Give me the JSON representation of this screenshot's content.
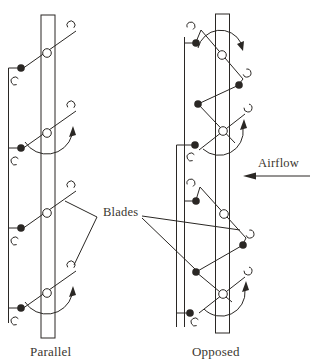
{
  "canvas": {
    "width": 313,
    "height": 363,
    "background": "#ffffff"
  },
  "style": {
    "line_color": "#2a2724",
    "text_color": "#3a362f",
    "pivot_fill": "#ffffff",
    "stroke_width": 1
  },
  "labels": {
    "parallel": {
      "text": "Parallel"
    },
    "opposed": {
      "text": "Opposed"
    },
    "blades": {
      "text": "Blades"
    },
    "airflow": {
      "text": "Airflow"
    }
  },
  "shapes": [
    {
      "name": "parallel-duct",
      "type": "rect",
      "x": 41,
      "y": 15,
      "w": 14,
      "h": 323
    },
    {
      "name": "parallel-drive-rod",
      "type": "line",
      "x1": 8.5,
      "y1": 68,
      "x2": 8.5,
      "y2": 323
    },
    {
      "name": "parallel-blade-1-line",
      "type": "line",
      "x1": 22,
      "y1": 69,
      "x2": 76,
      "y2": 31
    },
    {
      "name": "parallel-blade-1-top-hook",
      "type": "hook",
      "cx": 71,
      "cy": 25,
      "r": 4,
      "gap": 95
    },
    {
      "name": "parallel-blade-1-link-tick",
      "type": "line",
      "x1": 8.5,
      "y1": 68,
      "x2": 21,
      "y2": 68
    },
    {
      "name": "parallel-blade-1-crank-pin",
      "type": "dot",
      "cx": 21,
      "cy": 68,
      "r": 3.8
    },
    {
      "name": "parallel-blade-1-lower-hook",
      "type": "hook",
      "cx": 15,
      "cy": 81,
      "r": 4,
      "gap": 15
    },
    {
      "name": "parallel-blade-1-pivot",
      "type": "pivot",
      "cx": 47,
      "cy": 53,
      "r": 4.3
    },
    {
      "name": "parallel-blade-2-line",
      "type": "line",
      "x1": 22,
      "y1": 149,
      "x2": 76,
      "y2": 111
    },
    {
      "name": "parallel-blade-2-top-hook",
      "type": "hook",
      "cx": 71,
      "cy": 105,
      "r": 4,
      "gap": 95
    },
    {
      "name": "parallel-blade-2-link-tick",
      "type": "line",
      "x1": 8.5,
      "y1": 148,
      "x2": 21,
      "y2": 148
    },
    {
      "name": "parallel-blade-2-crank-pin",
      "type": "dot",
      "cx": 21,
      "cy": 148,
      "r": 3.8
    },
    {
      "name": "parallel-blade-2-lower-hook",
      "type": "hook",
      "cx": 15,
      "cy": 161,
      "r": 4,
      "gap": 15
    },
    {
      "name": "parallel-blade-2-pivot",
      "type": "pivot",
      "cx": 47,
      "cy": 133,
      "r": 4.3
    },
    {
      "name": "parallel-blade-2-rotation-arrow",
      "type": "rotarc",
      "x1": 25,
      "y1": 142,
      "x2": 72,
      "y2": 135,
      "r": 26,
      "sweep": 0,
      "arrow": [
        [
          73,
          126
        ],
        [
          69,
          137
        ],
        [
          76,
          135
        ]
      ]
    },
    {
      "name": "parallel-blade-3-line",
      "type": "line",
      "x1": 22,
      "y1": 229,
      "x2": 76,
      "y2": 191
    },
    {
      "name": "parallel-blade-3-top-hook",
      "type": "hook",
      "cx": 71,
      "cy": 185,
      "r": 4,
      "gap": 95
    },
    {
      "name": "parallel-blade-3-link-tick",
      "type": "line",
      "x1": 8.5,
      "y1": 228,
      "x2": 21,
      "y2": 228
    },
    {
      "name": "parallel-blade-3-crank-pin",
      "type": "dot",
      "cx": 21,
      "cy": 228,
      "r": 3.8
    },
    {
      "name": "parallel-blade-3-lower-hook",
      "type": "hook",
      "cx": 15,
      "cy": 241,
      "r": 4,
      "gap": 15
    },
    {
      "name": "parallel-blade-3-pivot",
      "type": "pivot",
      "cx": 47,
      "cy": 213,
      "r": 4.3
    },
    {
      "name": "parallel-blade-4-line",
      "type": "line",
      "x1": 22,
      "y1": 309,
      "x2": 76,
      "y2": 271
    },
    {
      "name": "parallel-blade-4-top-hook",
      "type": "hook",
      "cx": 71,
      "cy": 265,
      "r": 4,
      "gap": 95
    },
    {
      "name": "parallel-blade-4-link-tick",
      "type": "line",
      "x1": 8.5,
      "y1": 308,
      "x2": 21,
      "y2": 308
    },
    {
      "name": "parallel-blade-4-crank-pin",
      "type": "dot",
      "cx": 21,
      "cy": 308,
      "r": 3.8
    },
    {
      "name": "parallel-blade-4-lower-hook",
      "type": "hook",
      "cx": 15,
      "cy": 321,
      "r": 4,
      "gap": 15
    },
    {
      "name": "parallel-blade-4-pivot",
      "type": "pivot",
      "cx": 47,
      "cy": 293,
      "r": 4.3
    },
    {
      "name": "parallel-blade-4-rotation-arrow",
      "type": "rotarc",
      "x1": 25,
      "y1": 302,
      "x2": 72,
      "y2": 295,
      "r": 26,
      "sweep": 0,
      "arrow": [
        [
          73,
          286
        ],
        [
          69,
          297
        ],
        [
          76,
          295
        ]
      ]
    },
    {
      "name": "opposed-duct",
      "type": "rect",
      "x": 215.5,
      "y": 14,
      "w": 14,
      "h": 319
    },
    {
      "name": "opposed-drive-rod-upper",
      "type": "line",
      "x1": 184.5,
      "y1": 37,
      "x2": 184.5,
      "y2": 327
    },
    {
      "name": "opposed-drive-rod-lower",
      "type": "line",
      "x1": 176.5,
      "y1": 145,
      "x2": 176.5,
      "y2": 327
    },
    {
      "name": "opposed-link-tick-1",
      "type": "line",
      "x1": 184.5,
      "y1": 43,
      "x2": 193,
      "y2": 43
    },
    {
      "name": "opposed-link-tick-2",
      "type": "line",
      "x1": 176.5,
      "y1": 145,
      "x2": 192,
      "y2": 145
    },
    {
      "name": "opposed-link-tick-3",
      "type": "line",
      "x1": 184.5,
      "y1": 201,
      "x2": 193,
      "y2": 201
    },
    {
      "name": "opposed-link-tick-4",
      "type": "line",
      "x1": 176.5,
      "y1": 313,
      "x2": 187,
      "y2": 313
    },
    {
      "name": "opposed-blade-1-line",
      "type": "line",
      "x1": 201,
      "y1": 30,
      "x2": 243,
      "y2": 79
    },
    {
      "name": "opposed-blade-1-upper-arm",
      "type": "line",
      "x1": 201,
      "y1": 30,
      "x2": 196,
      "y2": 42
    },
    {
      "name": "opposed-blade-1-upper-pin",
      "type": "dot",
      "cx": 196,
      "cy": 43,
      "r": 3.8
    },
    {
      "name": "opposed-blade-1-upper-hook",
      "type": "hook",
      "cx": 191,
      "cy": 26,
      "r": 4,
      "gap": 110
    },
    {
      "name": "opposed-blade-1-lower-arm",
      "type": "line",
      "x1": 243,
      "y1": 79,
      "x2": 239,
      "y2": 84
    },
    {
      "name": "opposed-blade-1-lower-pin",
      "type": "dot",
      "cx": 239,
      "cy": 85,
      "r": 3.8
    },
    {
      "name": "opposed-blade-1-lower-hook",
      "type": "hook",
      "cx": 247,
      "cy": 73,
      "r": 4,
      "gap": 210
    },
    {
      "name": "opposed-blade-1-pivot",
      "type": "pivot",
      "cx": 222,
      "cy": 55,
      "r": 4.3
    },
    {
      "name": "opposed-blade-1-rotation-arrow",
      "type": "rotarc",
      "x1": 198,
      "y1": 48,
      "x2": 241,
      "y2": 43,
      "r": 23,
      "sweep": 1,
      "arrow": [
        [
          243,
          51
        ],
        [
          237,
          44
        ],
        [
          244,
          41
        ]
      ]
    },
    {
      "name": "opposed-link-blade1-blade2",
      "type": "line",
      "x1": 239,
      "y1": 85,
      "x2": 198,
      "y2": 104
    },
    {
      "name": "opposed-link-joint-pin-1",
      "type": "dot",
      "cx": 198,
      "cy": 104,
      "r": 3.8
    },
    {
      "name": "opposed-blade-2-crank-lever",
      "type": "line",
      "x1": 198,
      "y1": 104,
      "x2": 235,
      "y2": 143
    },
    {
      "name": "opposed-blade-2-line",
      "type": "line",
      "x1": 199,
      "y1": 150,
      "x2": 245,
      "y2": 114
    },
    {
      "name": "opposed-blade-2-top-hook",
      "type": "hook",
      "cx": 248,
      "cy": 108,
      "r": 4,
      "gap": 235
    },
    {
      "name": "opposed-blade-2-lower-pin",
      "type": "dot",
      "cx": 195,
      "cy": 145,
      "r": 3.8
    },
    {
      "name": "opposed-blade-2-lower-hook",
      "type": "hook",
      "cx": 191,
      "cy": 157,
      "r": 4,
      "gap": 15
    },
    {
      "name": "opposed-blade-2-pivot",
      "type": "pivot",
      "cx": 223,
      "cy": 131,
      "r": 4.3
    },
    {
      "name": "opposed-blade-2-rotation-arrow",
      "type": "rotarc",
      "x1": 203,
      "y1": 149,
      "x2": 243,
      "y2": 128,
      "r": 24,
      "sweep": 0,
      "arrow": [
        [
          244,
          119
        ],
        [
          240,
          130
        ],
        [
          247,
          128
        ]
      ]
    },
    {
      "name": "opposed-blade-3-line",
      "type": "line",
      "x1": 200,
      "y1": 187,
      "x2": 246,
      "y2": 238
    },
    {
      "name": "opposed-blade-3-upper-arm",
      "type": "line",
      "x1": 200,
      "y1": 187,
      "x2": 196,
      "y2": 200
    },
    {
      "name": "opposed-blade-3-upper-pin",
      "type": "dot",
      "cx": 196,
      "cy": 201,
      "r": 3.8
    },
    {
      "name": "opposed-blade-3-upper-hook",
      "type": "hook",
      "cx": 191,
      "cy": 183,
      "r": 4,
      "gap": 110
    },
    {
      "name": "opposed-blade-3-lower-arm",
      "type": "line",
      "x1": 246,
      "y1": 238,
      "x2": 243,
      "y2": 244
    },
    {
      "name": "opposed-blade-3-lower-pin",
      "type": "dot",
      "cx": 243,
      "cy": 245,
      "r": 3.8
    },
    {
      "name": "opposed-blade-3-lower-hook",
      "type": "hook",
      "cx": 250,
      "cy": 234,
      "r": 4,
      "gap": 210
    },
    {
      "name": "opposed-blade-3-pivot",
      "type": "pivot",
      "cx": 224,
      "cy": 214,
      "r": 4.3
    },
    {
      "name": "opposed-link-blade3-blade4",
      "type": "line",
      "x1": 243,
      "y1": 245,
      "x2": 196,
      "y2": 272
    },
    {
      "name": "opposed-link-joint-pin-2",
      "type": "dot",
      "cx": 196,
      "cy": 272,
      "r": 3.8
    },
    {
      "name": "opposed-blade-4-crank-lever",
      "type": "line",
      "x1": 196,
      "y1": 272,
      "x2": 232,
      "y2": 302
    },
    {
      "name": "opposed-blade-4-line",
      "type": "line",
      "x1": 199,
      "y1": 313,
      "x2": 245,
      "y2": 277
    },
    {
      "name": "opposed-blade-4-top-hook",
      "type": "hook",
      "cx": 248,
      "cy": 271,
      "r": 4,
      "gap": 235
    },
    {
      "name": "opposed-blade-4-lower-pin",
      "type": "dot",
      "cx": 190,
      "cy": 313,
      "r": 3.8
    },
    {
      "name": "opposed-blade-4-lower-hook",
      "type": "hook",
      "cx": 195,
      "cy": 322,
      "r": 4,
      "gap": 15
    },
    {
      "name": "opposed-blade-4-pivot",
      "type": "pivot",
      "cx": 223,
      "cy": 294,
      "r": 4.3
    },
    {
      "name": "opposed-blade-4-rotation-arrow",
      "type": "rotarc",
      "x1": 204,
      "y1": 309,
      "x2": 245,
      "y2": 290,
      "r": 24,
      "sweep": 0,
      "arrow": [
        [
          246,
          281
        ],
        [
          242,
          292
        ],
        [
          249,
          290
        ]
      ]
    },
    {
      "name": "blades-leader-left-upper",
      "type": "line",
      "x1": 97,
      "y1": 217,
      "x2": 65,
      "y2": 201
    },
    {
      "name": "blades-leader-left-lower",
      "type": "line",
      "x1": 97,
      "y1": 217,
      "x2": 74,
      "y2": 265
    },
    {
      "name": "blades-leader-right-upper",
      "type": "line",
      "x1": 142,
      "y1": 216,
      "x2": 240,
      "y2": 230
    },
    {
      "name": "blades-leader-right-lower",
      "type": "line",
      "x1": 142,
      "y1": 218,
      "x2": 195,
      "y2": 269
    },
    {
      "name": "airflow-arrow-shaft",
      "type": "line",
      "x1": 252,
      "y1": 176,
      "x2": 310,
      "y2": 176
    },
    {
      "name": "airflow-arrow-head",
      "type": "poly",
      "points": [
        [
          243,
          176
        ],
        [
          256,
          172.5
        ],
        [
          256,
          179.5
        ]
      ]
    }
  ]
}
